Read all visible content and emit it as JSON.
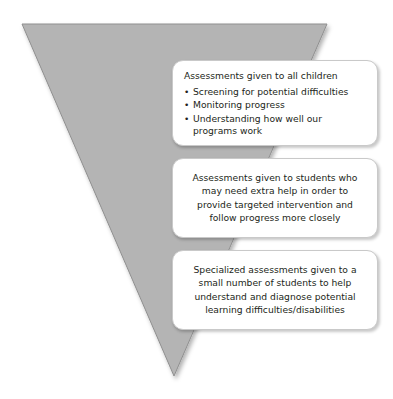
{
  "diagram": {
    "shape": {
      "name": "inverted-triangle",
      "fill_color": "#b4b4b4",
      "stroke_color": "#8f8f8f",
      "points": "22,24 327,24 174,376"
    },
    "colors": {
      "background": "#ffffff",
      "triangle_fill": "#b4b4b4",
      "box_fill": "#ffffff",
      "box_border": "#c9c9c9",
      "text": "#231f20"
    },
    "tiers": [
      {
        "id": "tier-1",
        "heading": "Assessments given to all children",
        "bullet_glyph": "•",
        "bullets": [
          "Screening for potential difficulties",
          "Monitoring progress",
          "Understanding how well our programs work"
        ],
        "body": ""
      },
      {
        "id": "tier-2",
        "heading": "",
        "bullets": [],
        "body": "Assessments given to students who may need extra help in order to provide targeted intervention and follow progress more closely"
      },
      {
        "id": "tier-3",
        "heading": "",
        "bullets": [],
        "body": "Specialized assessments given to a small number of students to help understand and diagnose potential learning difficulties/disabilities"
      }
    ]
  }
}
